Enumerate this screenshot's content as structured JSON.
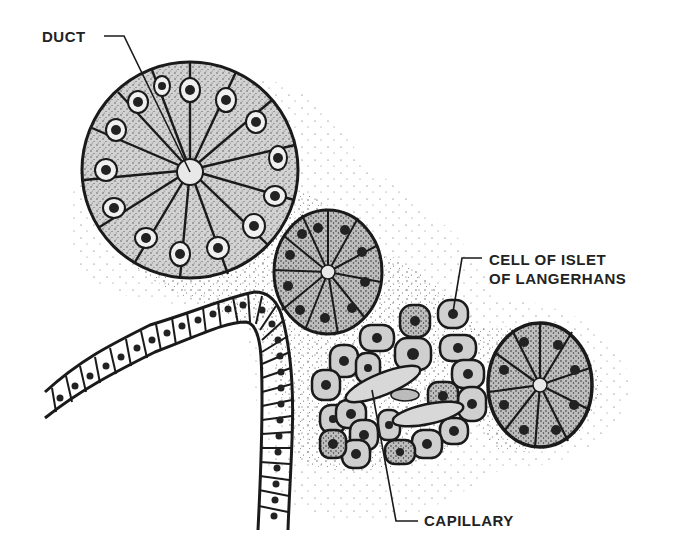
{
  "figure": {
    "style": "stippled pen-and-ink illustration",
    "colors": {
      "background": "#ffffff",
      "ink": "#1a1a1a",
      "cell_fill": "#cfcfcf",
      "duct_lumen": "#e8e8e8",
      "label_text": "#222222"
    }
  },
  "labels": {
    "duct": "DUCT",
    "islet_line1": "CELL OF ISLET",
    "islet_line2": "OF LANGERHANS",
    "capillary": "CAPILLARY"
  },
  "structures": [
    {
      "name": "large-acinus",
      "cells": 14,
      "center": [
        190,
        170
      ],
      "radius": 108
    },
    {
      "name": "medium-acinus",
      "cells": 11,
      "center": [
        328,
        272
      ],
      "radius": 56
    },
    {
      "name": "small-acinus",
      "cells": 10,
      "center": [
        540,
        385
      ],
      "radius": 54
    },
    {
      "name": "islet-of-langerhans",
      "center": [
        400,
        390
      ]
    },
    {
      "name": "duct-epithelium",
      "shape": "curved tube of cuboidal cells"
    }
  ]
}
